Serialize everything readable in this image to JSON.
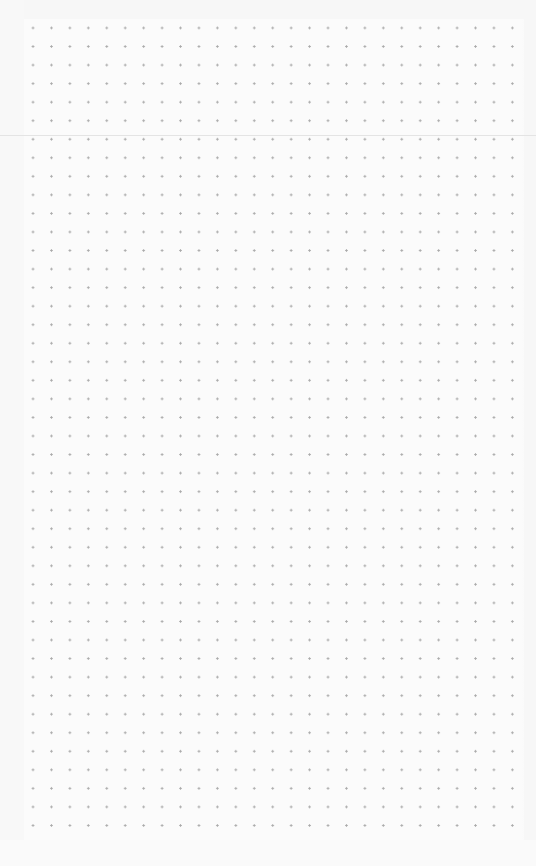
{
  "page": {
    "type": "blank-dot-grid-canvas",
    "background_color": "#fbfbfb",
    "dot_color": "#a9a9a9",
    "divider_color": "#e4e4e4",
    "grid": {
      "columns": 27,
      "rows": 44,
      "spacing_x": 18.45,
      "spacing_y": 18.55
    }
  }
}
